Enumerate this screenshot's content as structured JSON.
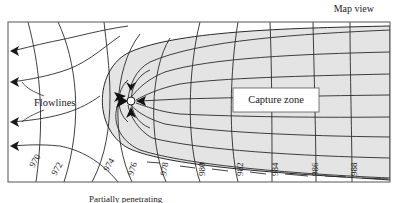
{
  "title": "Map view",
  "caption": "Partially penetrating",
  "labels": {
    "flowlines": "Flowlines",
    "capture_zone": "Capture zone"
  },
  "contours": [
    "970",
    "972",
    "974",
    "976",
    "978",
    "980",
    "982",
    "984",
    "986",
    "988"
  ],
  "colors": {
    "capture_zone_fill": "#e4e4e4",
    "line": "#2a2a2a",
    "frame": "#555555"
  }
}
